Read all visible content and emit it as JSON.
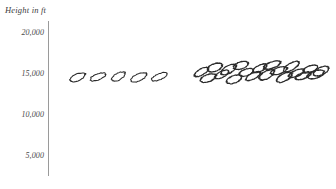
{
  "chart_data": {
    "type": "scatter",
    "title": "Height in ft",
    "ylabel": "Height in ft",
    "xlabel": "",
    "grid": false,
    "legend": null,
    "marker_style": "hand-drawn-ellipse",
    "marker_color": "#2b2b2b",
    "axis_color": "#9a9a9a",
    "background": "#ffffff",
    "y_axis": {
      "ticks": [
        20000,
        15000,
        10000,
        5000
      ],
      "tick_labels": [
        "20,000",
        "15,000",
        "10,000",
        "5,000"
      ],
      "ylim": [
        2500,
        21500
      ],
      "axis_line_visible": true,
      "tick_marks_visible": false
    },
    "x_axis": {
      "visible": false,
      "tick_labels": [],
      "xlim": [
        0,
        100
      ]
    },
    "series": [
      {
        "name": "heights",
        "points": [
          {
            "x": 6.5,
            "y": 14600
          },
          {
            "x": 14.0,
            "y": 14650
          },
          {
            "x": 21.5,
            "y": 14700
          },
          {
            "x": 29.0,
            "y": 14600
          },
          {
            "x": 36.5,
            "y": 14650
          },
          {
            "x": 52.0,
            "y": 15250
          },
          {
            "x": 54.5,
            "y": 14500
          },
          {
            "x": 57.0,
            "y": 15800
          },
          {
            "x": 59.5,
            "y": 14950
          },
          {
            "x": 62.0,
            "y": 15550
          },
          {
            "x": 64.0,
            "y": 14350
          },
          {
            "x": 66.5,
            "y": 16050
          },
          {
            "x": 68.5,
            "y": 15200
          },
          {
            "x": 71.0,
            "y": 14750
          },
          {
            "x": 73.5,
            "y": 15700
          },
          {
            "x": 76.0,
            "y": 14900
          },
          {
            "x": 78.0,
            "y": 16100
          },
          {
            "x": 80.5,
            "y": 15400
          },
          {
            "x": 82.5,
            "y": 14600
          },
          {
            "x": 85.0,
            "y": 15900
          },
          {
            "x": 87.0,
            "y": 15100
          },
          {
            "x": 89.5,
            "y": 14800
          },
          {
            "x": 92.0,
            "y": 15600
          },
          {
            "x": 94.0,
            "y": 14950
          },
          {
            "x": 96.0,
            "y": 15350
          }
        ]
      }
    ]
  }
}
